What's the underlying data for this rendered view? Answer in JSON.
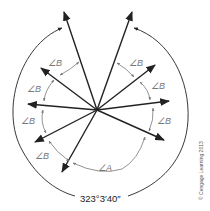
{
  "diagram": {
    "center": {
      "x": 97,
      "y": 110
    },
    "colors": {
      "ray": "#222222",
      "small_arc": "#777777",
      "outer_arc": "#222222",
      "label": "#777777",
      "caption": "#222222"
    },
    "rays": [
      {
        "id": "ray-1",
        "tip_x": 64,
        "tip_y": 12
      },
      {
        "id": "ray-2",
        "tip_x": 41,
        "tip_y": 68
      },
      {
        "id": "ray-3",
        "tip_x": 28,
        "tip_y": 104
      },
      {
        "id": "ray-4",
        "tip_x": 35,
        "tip_y": 142
      },
      {
        "id": "ray-5",
        "tip_x": 62,
        "tip_y": 172
      },
      {
        "id": "ray-6",
        "tip_x": 132,
        "tip_y": 12
      },
      {
        "id": "ray-7",
        "tip_x": 155,
        "tip_y": 65
      },
      {
        "id": "ray-8",
        "tip_x": 169,
        "tip_y": 101
      },
      {
        "id": "ray-9",
        "tip_x": 164,
        "tip_y": 140
      }
    ],
    "angle_labels": [
      {
        "id": "angle-b-1",
        "text": "∠B",
        "x": 48,
        "y": 66
      },
      {
        "id": "angle-b-2",
        "text": "∠B",
        "x": 27,
        "y": 92
      },
      {
        "id": "angle-b-3",
        "text": "∠B",
        "x": 21,
        "y": 124
      },
      {
        "id": "angle-b-4",
        "text": "∠B",
        "x": 35,
        "y": 159
      },
      {
        "id": "angle-b-5",
        "text": "∠B",
        "x": 129,
        "y": 66
      },
      {
        "id": "angle-b-6",
        "text": "∠B",
        "x": 151,
        "y": 89
      },
      {
        "id": "angle-b-7",
        "text": "∠B",
        "x": 157,
        "y": 124
      },
      {
        "id": "angle-a",
        "text": "∠A",
        "x": 98,
        "y": 171
      }
    ],
    "total_angle_label": "323°3′40″",
    "credit": "© Cengage Learning 2013"
  }
}
